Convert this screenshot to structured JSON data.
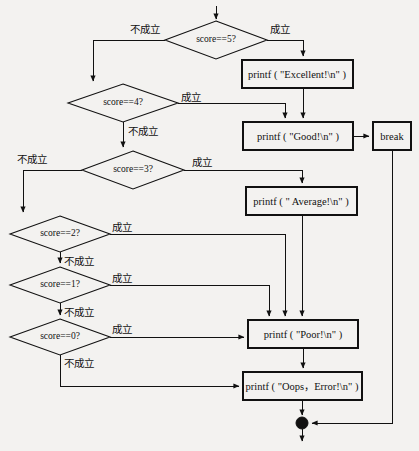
{
  "diagram": {
    "type": "flowchart",
    "language": "mixed-chinese-c",
    "labels": {
      "true_branch": "成立",
      "false_branch": "不成立"
    },
    "nodes": [
      {
        "id": "d5",
        "kind": "decision",
        "text": "score==5?",
        "cx": 216,
        "cy": 40,
        "rx": 51,
        "ry": 19
      },
      {
        "id": "d4",
        "kind": "decision",
        "text": "score==4?",
        "cx": 123,
        "cy": 103,
        "rx": 55,
        "ry": 19
      },
      {
        "id": "d3",
        "kind": "decision",
        "text": "score==3?",
        "cx": 133,
        "cy": 170,
        "rx": 51,
        "ry": 19
      },
      {
        "id": "d2",
        "kind": "decision",
        "text": "score==2?",
        "cx": 60,
        "cy": 234,
        "rx": 50,
        "ry": 18
      },
      {
        "id": "d1",
        "kind": "decision",
        "text": "score==1?",
        "cx": 60,
        "cy": 285,
        "rx": 50,
        "ry": 18
      },
      {
        "id": "d0",
        "kind": "decision",
        "text": "score==0?",
        "cx": 60,
        "cy": 337,
        "rx": 50,
        "ry": 18
      },
      {
        "id": "p_excellent",
        "kind": "process",
        "text": "printf ( \"Excellent!\\n\" )",
        "x": 242,
        "y": 60,
        "w": 111,
        "h": 28
      },
      {
        "id": "p_good",
        "kind": "process",
        "text": "printf ( \"Good!\\n\" )",
        "x": 243,
        "y": 122,
        "w": 110,
        "h": 28
      },
      {
        "id": "p_break",
        "kind": "process",
        "text": "break",
        "x": 373,
        "y": 122,
        "w": 38,
        "h": 28
      },
      {
        "id": "p_average",
        "kind": "process",
        "text": "printf ( \" Average!\\n\" )",
        "x": 246,
        "y": 187,
        "w": 111,
        "h": 28
      },
      {
        "id": "p_poor",
        "kind": "process",
        "text": "printf ( \"Poor!\\n\" )",
        "x": 248,
        "y": 320,
        "w": 110,
        "h": 28
      },
      {
        "id": "p_oops",
        "kind": "process",
        "text": "printf ( \"Oops，Error!\\n\" )",
        "x": 243,
        "y": 372,
        "w": 119,
        "h": 28
      },
      {
        "id": "junction",
        "kind": "connector",
        "text": "",
        "cx": 302,
        "cy": 423,
        "r": 6
      }
    ],
    "edge_labels": [
      {
        "id": "e1",
        "text": "不成立",
        "x": 130,
        "y": 24
      },
      {
        "id": "e2",
        "text": "成立",
        "x": 270,
        "y": 24
      },
      {
        "id": "e3",
        "text": "成立",
        "x": 181,
        "y": 92
      },
      {
        "id": "e4",
        "text": "不成立",
        "x": 128,
        "y": 126
      },
      {
        "id": "e5",
        "text": "不成立",
        "x": 17,
        "y": 154
      },
      {
        "id": "e6",
        "text": "成立",
        "x": 192,
        "y": 157
      },
      {
        "id": "e7",
        "text": "成立",
        "x": 112,
        "y": 222
      },
      {
        "id": "e8",
        "text": "不成立",
        "x": 64,
        "y": 256
      },
      {
        "id": "e9",
        "text": "成立",
        "x": 112,
        "y": 273
      },
      {
        "id": "e10",
        "text": "不成立",
        "x": 64,
        "y": 307
      },
      {
        "id": "e11",
        "text": "成立",
        "x": 112,
        "y": 324
      },
      {
        "id": "e12",
        "text": "不成立",
        "x": 64,
        "y": 358
      }
    ]
  }
}
